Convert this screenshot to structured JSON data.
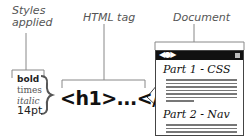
{
  "labels": {
    "styles_line1": "Styles",
    "styles_line2": "applied",
    "html_tag": "HTML tag",
    "document": "Document"
  },
  "styles": [
    "bold",
    "times",
    "italic",
    "14pt"
  ],
  "tag": "<h1>...</h1>",
  "document": {
    "nav_icons": "◀●▶",
    "heading1": "Part 1 - CSS",
    "heading2": "Part 2 - Nav"
  }
}
